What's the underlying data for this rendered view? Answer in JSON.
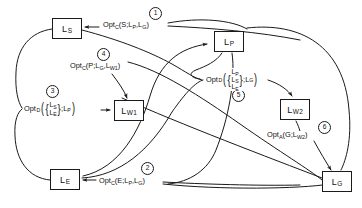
{
  "diagram": {
    "type": "flow-graph",
    "title": "",
    "nodes": [
      {
        "id": "LS",
        "label": "L",
        "sub": "S",
        "x": 52,
        "y": 18,
        "w": 30,
        "h": 21
      },
      {
        "id": "LP",
        "label": "L",
        "sub": "P",
        "x": 214,
        "y": 31,
        "w": 30,
        "h": 21
      },
      {
        "id": "LW1",
        "label": "L",
        "sub": "W1",
        "x": 114,
        "y": 100,
        "w": 30,
        "h": 21
      },
      {
        "id": "LW2",
        "label": "L",
        "sub": "W2",
        "x": 280,
        "y": 99,
        "w": 30,
        "h": 21
      },
      {
        "id": "LE",
        "label": "L",
        "sub": "E",
        "x": 50,
        "y": 169,
        "w": 30,
        "h": 21
      },
      {
        "id": "LG",
        "label": "L",
        "sub": "G",
        "x": 322,
        "y": 171,
        "w": 30,
        "h": 21
      }
    ],
    "edge_labels": [
      {
        "id": "label1",
        "step": "1",
        "text": "Opt",
        "op_sub": "C",
        "args": "(S;L",
        "arg_sub1": "P",
        "args2": ",L",
        "arg_sub2": "G",
        "args3": ")",
        "full": "Opt_C(S;L_P,L_G)",
        "x": 102,
        "y": 21,
        "badge_x": 149,
        "badge_y": 7
      },
      {
        "id": "label2",
        "step": "2",
        "text": "Opt",
        "op_sub": "C",
        "args": "(E;L",
        "arg_sub1": "P",
        "args2": ",L",
        "arg_sub2": "G",
        "args3": ")",
        "full": "Opt_C(E;L_P,L_G)",
        "x": 98,
        "y": 177,
        "badge_x": 141,
        "badge_y": 162
      },
      {
        "id": "label4",
        "step": "4",
        "text": "Opt",
        "op_sub": "C",
        "args": "(P;L",
        "arg_sub1": "G",
        "args2": ",L",
        "arg_sub2": "W1",
        "args3": ")",
        "full": "Opt_C(P;L_G,L_W1)",
        "x": 69,
        "y": 62,
        "badge_x": 97,
        "badge_y": 48
      },
      {
        "id": "label6",
        "step": "6",
        "text": "Opt",
        "op_sub": "A",
        "args": "(G;L",
        "arg_sub1": "W2",
        "args2": "",
        "arg_sub2": "",
        "args3": ")",
        "full": "Opt_A(G;L_W2)",
        "x": 266,
        "y": 131,
        "badge_x": 318,
        "badge_y": 121
      }
    ],
    "set_labels": [
      {
        "id": "label3",
        "step": "3",
        "prefix": "Opt",
        "op_sub": "D",
        "members": [
          {
            "base": "L",
            "sub": "S"
          },
          {
            "base": "L",
            "sub": "E"
          }
        ],
        "target": "L",
        "target_sub": "P",
        "full": "Opt_D({L_S,L_E};L_P)",
        "x": 24,
        "y": 101,
        "badge_x": 46,
        "badge_y": 85
      },
      {
        "id": "label5",
        "step": "5",
        "prefix": "Opt",
        "op_sub": "D",
        "members": [
          {
            "base": "L",
            "sub": "P"
          },
          {
            "base": "L",
            "sub": "S"
          },
          {
            "base": "L",
            "sub": "E"
          }
        ],
        "target": "L",
        "target_sub": "G",
        "full": "Opt_D({L_P,L_S,L_E};L_G)",
        "x": 206,
        "y": 68,
        "badge_x": 232,
        "badge_y": 89
      }
    ],
    "colors": {
      "stroke": "#1a1a1a",
      "background": "#ffffff",
      "text": "#111111"
    }
  }
}
